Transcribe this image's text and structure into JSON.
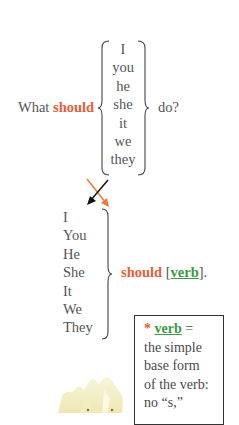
{
  "question": {
    "prefix": "What ",
    "modal": "should",
    "suffix": "do?",
    "pronouns": [
      "I",
      "you",
      "he",
      "she",
      "it",
      "we",
      "they"
    ]
  },
  "answer": {
    "pronouns": [
      "I",
      "You",
      "He",
      "She",
      "It",
      "We",
      "They"
    ],
    "modal": "should",
    "bracket_open": " [",
    "verb": "verb",
    "bracket_close": "]."
  },
  "note": {
    "star": "*",
    "term": "verb",
    "equals": " =",
    "lines": [
      "the simple",
      "base form",
      "of the verb:",
      "no “s,”"
    ]
  },
  "colors": {
    "text": "#555555",
    "modal": "#e8603a",
    "verb": "#3a9a44",
    "arrow_black": "#111111",
    "arrow_orange": "#e8603a"
  },
  "icons": {
    "left_brace": "left-brace",
    "right_brace": "right-brace",
    "arrow_down_left": "arrow-down-left",
    "arrow_down_right": "arrow-down-right",
    "candle_image": "candle-image"
  }
}
